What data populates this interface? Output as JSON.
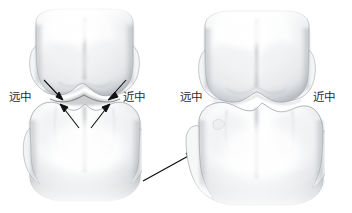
{
  "figure": {
    "background_color": "#ffffff",
    "width": 352,
    "height": 213,
    "panels": [
      {
        "id": "left-panel",
        "name": "open-contact-panel",
        "description": "开放性接触（齿隙）",
        "labels": {
          "left": "远中",
          "right": "近中"
        },
        "teeth": [
          {
            "id": "upper-molar-left",
            "name": "upper-molar",
            "position": "upper"
          },
          {
            "id": "lower-molar-left",
            "name": "lower-molar",
            "position": "lower"
          }
        ],
        "annotation_arrows": 4
      },
      {
        "id": "right-panel",
        "name": "tight-contact-panel",
        "description": "紧密接触关系",
        "labels": {
          "left": "远中",
          "right": "近中"
        },
        "teeth": [
          {
            "id": "upper-molar-right",
            "name": "upper-molar",
            "position": "upper"
          },
          {
            "id": "lower-molar-right",
            "name": "lower-molar",
            "position": "lower"
          }
        ],
        "annotation_arrows": 0
      }
    ],
    "transition_arrow": {
      "name": "transition-arrow",
      "direction": "up-right",
      "from": [
        143,
        181
      ],
      "to": [
        196,
        151
      ]
    },
    "colors": {
      "tooth_fill": "#ffffff",
      "tooth_shadow": "#b9bcc0",
      "tooth_deep_shadow": "#8e9296",
      "outline": "#9ba0a5",
      "arrow": "#111111",
      "label": "#2b2b2b"
    }
  }
}
